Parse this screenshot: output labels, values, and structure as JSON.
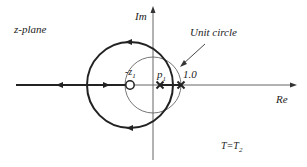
{
  "diagram": {
    "plane_label": "z-plane",
    "im_axis_label": "Im",
    "re_axis_label": "Re",
    "unit_circle_label": "Unit circle",
    "zero_label": "-z",
    "zero_label_sub": "1",
    "pole_label": "p",
    "pole_label_sub": "1",
    "one_label": "1.0",
    "condition_label": "T=T",
    "condition_label_sub": "2",
    "elements": {
      "zero_marker": "circle-o",
      "pole_markers": [
        "x",
        "x"
      ],
      "locus_direction_arrows": [
        "left",
        "right",
        "left-top",
        "bottom"
      ]
    },
    "colors": {
      "ink": "#222222",
      "thin": "#555555"
    }
  }
}
